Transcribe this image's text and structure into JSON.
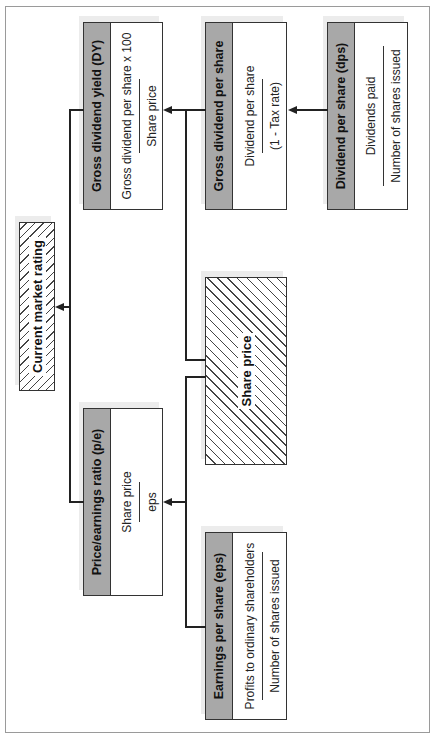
{
  "diagram": {
    "orientation": "rotated-90-ccw",
    "nodes": {
      "current_market_rating": {
        "title": "Current market rating"
      },
      "gross_dividend_yield": {
        "title": "Gross dividend yield (DY)",
        "numerator": "Gross dividend per share x 100",
        "denominator": "Share price"
      },
      "pe_ratio": {
        "title": "Price/earnings ratio (p/e)",
        "numerator": "Share price",
        "denominator": "eps"
      },
      "gross_dividend_per_share": {
        "title": "Gross dividend per share",
        "numerator": "Dividend per share",
        "denominator": "(1 - Tax rate)"
      },
      "share_price": {
        "title": "Share price"
      },
      "dividend_per_share": {
        "title": "Dividend per share (dps)",
        "numerator": "Dividends paid",
        "denominator": "Number of shares issued"
      },
      "earnings_per_share": {
        "title": "Earnings per share (eps)",
        "numerator": "Profits to ordinary shareholders",
        "denominator": "Number of shares issued"
      }
    },
    "edges": [
      {
        "from": "gross_dividend_yield",
        "to": "current_market_rating"
      },
      {
        "from": "pe_ratio",
        "to": "current_market_rating"
      },
      {
        "from": "gross_dividend_per_share",
        "to": "gross_dividend_yield"
      },
      {
        "from": "share_price",
        "to": "gross_dividend_yield"
      },
      {
        "from": "share_price",
        "to": "pe_ratio"
      },
      {
        "from": "earnings_per_share",
        "to": "pe_ratio"
      },
      {
        "from": "dividend_per_share",
        "to": "gross_dividend_per_share"
      }
    ],
    "colors": {
      "header_fill": "#a8a8a8",
      "line": "#222222",
      "border": "#333333"
    }
  }
}
